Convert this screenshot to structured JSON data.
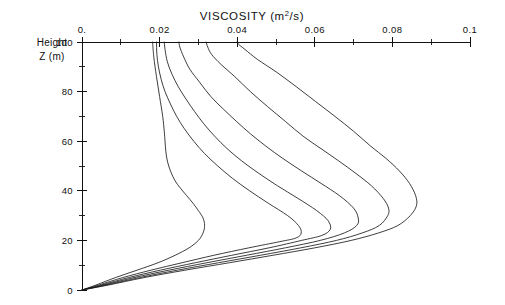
{
  "chart_data": {
    "type": "line",
    "title": "VISCOSITY (m2/s)",
    "title_parts": {
      "main": "VISCOSITY (m",
      "sup": "2",
      "tail": "/s)"
    },
    "xlabel": "VISCOSITY (m2/s)",
    "ylabel": "Height Z (m)",
    "ylabel_line1": "Height",
    "ylabel_line2": "Z (m)",
    "xlim": [
      0,
      0.1
    ],
    "ylim": [
      0,
      100
    ],
    "x_axis_position": "top",
    "grid": false,
    "legend": null,
    "xticks": [
      0,
      0.02,
      0.04,
      0.06,
      0.08,
      0.1
    ],
    "xticklabels": [
      "0.",
      "0.02",
      "0.04",
      "0.06",
      "0.08",
      "0.1"
    ],
    "xminorticks": [
      0.01,
      0.03,
      0.05,
      0.07,
      0.09
    ],
    "yticks": [
      0,
      20,
      40,
      60,
      80,
      100
    ],
    "yticklabels": [
      "0",
      "20",
      "40",
      "60",
      "80",
      "100"
    ],
    "yminorticks": [
      10,
      30,
      50,
      70,
      90
    ],
    "series": [
      {
        "name": "profile-1",
        "top_value": 0.0192,
        "max_value": 0.0565,
        "max_height": 20,
        "points": [
          [
            0.0,
            0
          ],
          [
            0.0043,
            2
          ],
          [
            0.0105,
            5
          ],
          [
            0.0178,
            8
          ],
          [
            0.0258,
            11
          ],
          [
            0.034,
            14
          ],
          [
            0.043,
            17
          ],
          [
            0.051,
            19.5
          ],
          [
            0.0552,
            21
          ],
          [
            0.0565,
            23
          ],
          [
            0.0558,
            26
          ],
          [
            0.053,
            30
          ],
          [
            0.048,
            35
          ],
          [
            0.0432,
            40
          ],
          [
            0.0388,
            45
          ],
          [
            0.035,
            50
          ],
          [
            0.0316,
            55
          ],
          [
            0.0288,
            60
          ],
          [
            0.0264,
            65
          ],
          [
            0.0244,
            70
          ],
          [
            0.0228,
            75
          ],
          [
            0.0214,
            80
          ],
          [
            0.0204,
            85
          ],
          [
            0.0197,
            90
          ],
          [
            0.0193,
            95
          ],
          [
            0.0192,
            100
          ]
        ]
      },
      {
        "name": "profile-2",
        "top_value": 0.0212,
        "max_value": 0.064,
        "max_height": 22,
        "points": [
          [
            0.0,
            0
          ],
          [
            0.005,
            2
          ],
          [
            0.012,
            5
          ],
          [
            0.0202,
            8
          ],
          [
            0.0292,
            11
          ],
          [
            0.0386,
            14
          ],
          [
            0.0482,
            17
          ],
          [
            0.0566,
            20
          ],
          [
            0.0618,
            22
          ],
          [
            0.064,
            24.5
          ],
          [
            0.0634,
            28
          ],
          [
            0.0605,
            32
          ],
          [
            0.0556,
            37
          ],
          [
            0.0504,
            42
          ],
          [
            0.0456,
            47
          ],
          [
            0.0412,
            52
          ],
          [
            0.0374,
            57
          ],
          [
            0.0342,
            62
          ],
          [
            0.0314,
            67
          ],
          [
            0.029,
            72
          ],
          [
            0.0268,
            77
          ],
          [
            0.0248,
            82
          ],
          [
            0.0232,
            87
          ],
          [
            0.022,
            92
          ],
          [
            0.0214,
            97
          ],
          [
            0.0212,
            100
          ]
        ]
      },
      {
        "name": "profile-3",
        "top_value": 0.025,
        "max_value": 0.0712,
        "max_height": 26,
        "points": [
          [
            0.0,
            0
          ],
          [
            0.0056,
            2
          ],
          [
            0.0134,
            5
          ],
          [
            0.0224,
            8
          ],
          [
            0.0322,
            11
          ],
          [
            0.0424,
            14
          ],
          [
            0.0524,
            17
          ],
          [
            0.0614,
            20
          ],
          [
            0.0676,
            23
          ],
          [
            0.0708,
            26
          ],
          [
            0.0712,
            29
          ],
          [
            0.07,
            33
          ],
          [
            0.0664,
            38
          ],
          [
            0.0616,
            43
          ],
          [
            0.0566,
            48
          ],
          [
            0.0518,
            53
          ],
          [
            0.0474,
            58
          ],
          [
            0.0434,
            63
          ],
          [
            0.0398,
            68
          ],
          [
            0.0364,
            73
          ],
          [
            0.0332,
            78
          ],
          [
            0.0302,
            84
          ],
          [
            0.0278,
            89
          ],
          [
            0.0262,
            94
          ],
          [
            0.0252,
            98
          ],
          [
            0.025,
            100
          ]
        ]
      },
      {
        "name": "profile-4",
        "top_value": 0.032,
        "max_value": 0.079,
        "max_height": 30,
        "points": [
          [
            0.0,
            0
          ],
          [
            0.0062,
            2
          ],
          [
            0.0148,
            5
          ],
          [
            0.0246,
            8
          ],
          [
            0.0352,
            11
          ],
          [
            0.046,
            14
          ],
          [
            0.0564,
            17
          ],
          [
            0.0656,
            20
          ],
          [
            0.0722,
            23
          ],
          [
            0.0766,
            26
          ],
          [
            0.0788,
            30
          ],
          [
            0.079,
            33
          ],
          [
            0.0776,
            37
          ],
          [
            0.0746,
            42
          ],
          [
            0.0706,
            47
          ],
          [
            0.0662,
            52
          ],
          [
            0.0616,
            57
          ],
          [
            0.057,
            62
          ],
          [
            0.0524,
            68
          ],
          [
            0.0478,
            74
          ],
          [
            0.0434,
            80
          ],
          [
            0.0394,
            86
          ],
          [
            0.0358,
            91
          ],
          [
            0.0334,
            95
          ],
          [
            0.0324,
            98
          ],
          [
            0.032,
            100
          ]
        ]
      },
      {
        "name": "profile-5",
        "top_value": 0.04,
        "max_value": 0.0862,
        "max_height": 34,
        "points": [
          [
            0.0,
            0
          ],
          [
            0.0068,
            2
          ],
          [
            0.016,
            5
          ],
          [
            0.0266,
            8
          ],
          [
            0.038,
            11
          ],
          [
            0.0492,
            14
          ],
          [
            0.06,
            17
          ],
          [
            0.0694,
            20
          ],
          [
            0.0764,
            23
          ],
          [
            0.0814,
            26
          ],
          [
            0.0846,
            30
          ],
          [
            0.0862,
            34
          ],
          [
            0.086,
            38
          ],
          [
            0.0844,
            43
          ],
          [
            0.0818,
            48
          ],
          [
            0.0784,
            53
          ],
          [
            0.0744,
            58
          ],
          [
            0.07,
            64
          ],
          [
            0.0652,
            70
          ],
          [
            0.0602,
            76
          ],
          [
            0.0552,
            82
          ],
          [
            0.05,
            88
          ],
          [
            0.0452,
            93
          ],
          [
            0.042,
            97
          ],
          [
            0.0404,
            99
          ],
          [
            0.04,
            100
          ]
        ]
      },
      {
        "name": "profile-inner",
        "top_value": 0.0182,
        "max_value": 0.0222,
        "max_height": 38,
        "points": [
          [
            0.0,
            0
          ],
          [
            0.0036,
            2
          ],
          [
            0.0086,
            5
          ],
          [
            0.0142,
            8
          ],
          [
            0.0196,
            11
          ],
          [
            0.024,
            14
          ],
          [
            0.0276,
            17
          ],
          [
            0.03,
            20
          ],
          [
            0.0312,
            23
          ],
          [
            0.0316,
            26
          ],
          [
            0.0312,
            29
          ],
          [
            0.03,
            32
          ],
          [
            0.0286,
            35
          ],
          [
            0.027,
            38
          ],
          [
            0.0254,
            41
          ],
          [
            0.024,
            44
          ],
          [
            0.0228,
            48
          ],
          [
            0.022,
            52
          ],
          [
            0.0216,
            56
          ],
          [
            0.0214,
            60
          ],
          [
            0.0212,
            64
          ],
          [
            0.0208,
            70
          ],
          [
            0.02,
            78
          ],
          [
            0.0192,
            86
          ],
          [
            0.0185,
            94
          ],
          [
            0.0182,
            100
          ]
        ]
      }
    ]
  }
}
